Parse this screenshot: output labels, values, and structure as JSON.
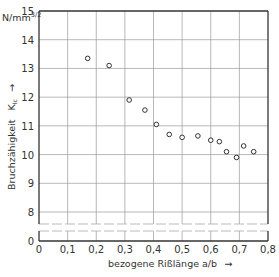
{
  "chart_data": {
    "type": "scatter",
    "title": "",
    "xlabel": "bezogene Rißlänge  a/b",
    "ylabel": "Bruchzähigkeit  K_Ic",
    "y_unit": "N/mm^3/2",
    "xlim": [
      0,
      0.8
    ],
    "ylim": [
      0,
      15
    ],
    "y_axis_break": [
      0,
      7.6
    ],
    "x_ticks": [
      "0",
      "0,1",
      "0,2",
      "0,3",
      "0,4",
      "0,5",
      "0,6",
      "0,7",
      "0,8"
    ],
    "y_ticks": [
      "0",
      "8",
      "9",
      "10",
      "11",
      "12",
      "13",
      "14",
      "15"
    ],
    "grid": true,
    "legend": null,
    "series": [
      {
        "name": "K_Ic",
        "marker": "open-circle",
        "points": [
          {
            "x": 0.17,
            "y": 13.35
          },
          {
            "x": 0.245,
            "y": 13.1
          },
          {
            "x": 0.315,
            "y": 11.9
          },
          {
            "x": 0.37,
            "y": 11.55
          },
          {
            "x": 0.41,
            "y": 11.05
          },
          {
            "x": 0.455,
            "y": 10.7
          },
          {
            "x": 0.5,
            "y": 10.6
          },
          {
            "x": 0.555,
            "y": 10.65
          },
          {
            "x": 0.6,
            "y": 10.5
          },
          {
            "x": 0.63,
            "y": 10.45
          },
          {
            "x": 0.655,
            "y": 10.1
          },
          {
            "x": 0.69,
            "y": 9.9
          },
          {
            "x": 0.715,
            "y": 10.3
          },
          {
            "x": 0.75,
            "y": 10.1
          }
        ]
      }
    ]
  },
  "labels": {
    "y_unit": "N/mm",
    "y_unit_sup": "3/2",
    "y_title": "Bruchzähigkeit",
    "y_symbol": "K",
    "y_symbol_sub": "Ic",
    "x_title": "bezogene Rißlänge  a/b",
    "arrow": "→"
  }
}
